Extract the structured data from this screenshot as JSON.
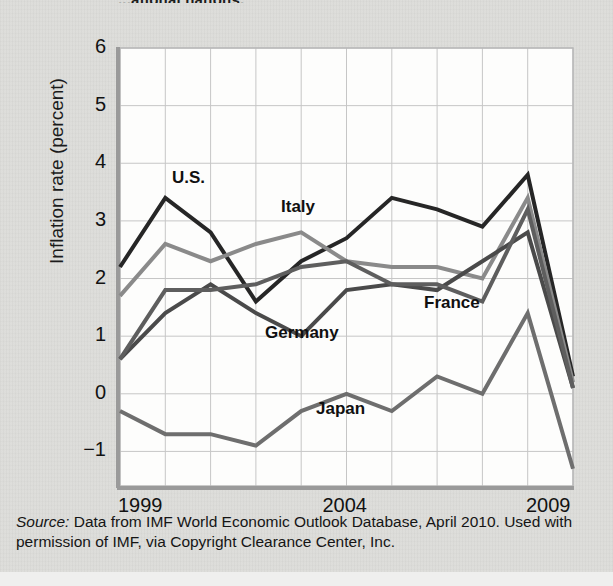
{
  "figure": {
    "cut_title": "...ational nations.",
    "source_prefix": "Source:",
    "source_text": " Data from IMF World Economic Outlook Database, April 2010. Used with permission of IMF, via Copyright Clearance Center, Inc."
  },
  "chart_data": {
    "type": "line",
    "title": "",
    "xlabel": "",
    "ylabel": "Inflation rate (percent)",
    "x": [
      1999,
      2000,
      2001,
      2002,
      2003,
      2004,
      2005,
      2006,
      2007,
      2008,
      2009
    ],
    "xtick_labels": [
      "1999",
      "2004",
      "2009"
    ],
    "xtick_values": [
      1999,
      2004,
      2009
    ],
    "ytick_labels": [
      "6",
      "5",
      "4",
      "3",
      "2",
      "1",
      "0",
      "−1"
    ],
    "ytick_values": [
      6,
      5,
      4,
      3,
      2,
      1,
      0,
      -1
    ],
    "xlim": [
      1999,
      2009
    ],
    "ylim": [
      -1.6,
      6
    ],
    "grid": true,
    "legend": "inline-labels",
    "series": [
      {
        "name": "U.S.",
        "color": "#262626",
        "values": [
          2.2,
          3.4,
          2.8,
          1.6,
          2.3,
          2.7,
          3.4,
          3.2,
          2.9,
          3.8,
          0.3
        ],
        "label_x": 172,
        "label_y": 168
      },
      {
        "name": "Italy",
        "color": "#8a8a8a",
        "values": [
          1.7,
          2.6,
          2.3,
          2.6,
          2.8,
          2.3,
          2.2,
          2.2,
          2.0,
          3.4,
          0.2
        ],
        "label_x": 281,
        "label_y": 197
      },
      {
        "name": "Germany",
        "color": "#4a4a4a",
        "values": [
          0.6,
          1.4,
          1.9,
          1.4,
          1.0,
          1.8,
          1.9,
          1.8,
          2.3,
          2.8,
          0.1
        ],
        "label_x": 265,
        "label_y": 323
      },
      {
        "name": "France",
        "color": "#5e5e5e",
        "values": [
          0.6,
          1.8,
          1.8,
          1.9,
          2.2,
          2.3,
          1.9,
          1.9,
          1.6,
          3.2,
          0.1
        ],
        "label_x": 424,
        "label_y": 293
      },
      {
        "name": "Japan",
        "color": "#6e6e6e",
        "values": [
          -0.3,
          -0.7,
          -0.7,
          -0.9,
          -0.3,
          0.0,
          -0.3,
          0.3,
          0.0,
          1.4,
          -1.3
        ],
        "label_x": 316,
        "label_y": 399
      }
    ]
  },
  "plot_geometry": {
    "left": 120,
    "right": 573,
    "top": 48,
    "bottom": 486
  }
}
